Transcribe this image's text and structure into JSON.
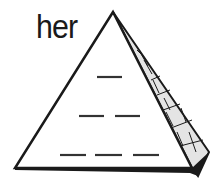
{
  "worksheet": {
    "word": "her",
    "pyramid": {
      "rows": [
        {
          "blanks": 1
        },
        {
          "blanks": 2
        },
        {
          "blanks": 3
        }
      ]
    }
  },
  "colors": {
    "ink": "#1a1a1a",
    "face": "#ffffff",
    "side_fill": "#e4e4e4"
  }
}
